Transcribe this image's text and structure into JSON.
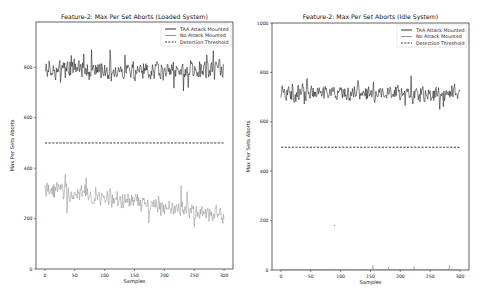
{
  "chart_data": [
    {
      "type": "line",
      "title": "Feature-2: Max Per Set Aborts (Loaded System)",
      "xlabel": "Samples",
      "ylabel": "Max Per Sets Aborts",
      "xlim": [
        -15,
        315
      ],
      "ylim": [
        0,
        980
      ],
      "xticks": [
        0,
        50,
        100,
        150,
        200,
        250,
        300
      ],
      "yticks": [
        0,
        200,
        400,
        600,
        800
      ],
      "grid": false,
      "legend_position": "upper right",
      "legend": [
        "TAA Attack Mounted",
        "No Attack Mounted",
        "Detection Threshold"
      ],
      "series": [
        {
          "name": "TAA Attack Mounted",
          "color": "#1a1a1a",
          "style": "solid",
          "mean": 790,
          "spread": 35,
          "min": 680,
          "max": 870,
          "seed": 7,
          "sample_x": [
            0,
            25,
            50,
            75,
            100,
            125,
            150,
            175,
            200,
            225,
            250,
            275,
            300
          ],
          "sample_values": [
            790,
            800,
            820,
            780,
            770,
            790,
            810,
            780,
            790,
            780,
            785,
            770,
            800
          ]
        },
        {
          "name": "No Attack Mounted",
          "color": "#8a8a8a",
          "style": "solid",
          "start_mean": 320,
          "end_mean": 210,
          "spread": 35,
          "min": 135,
          "max": 385,
          "seed": 13,
          "sample_x": [
            0,
            25,
            50,
            75,
            100,
            125,
            150,
            175,
            200,
            225,
            250,
            275,
            300
          ],
          "sample_values": [
            330,
            290,
            280,
            290,
            260,
            290,
            270,
            280,
            260,
            250,
            240,
            230,
            200
          ]
        },
        {
          "name": "Detection Threshold",
          "color": "#222222",
          "style": "dashed",
          "value": 500
        }
      ]
    },
    {
      "type": "line",
      "title": "Feature-2: Max Per Set Aborts (Idle System)",
      "xlabel": "Samples",
      "ylabel": "Max Per Sets Aborts",
      "xlim": [
        -15,
        315
      ],
      "ylim": [
        0,
        1000
      ],
      "xticks": [
        0,
        50,
        100,
        150,
        200,
        250,
        300
      ],
      "yticks": [
        0,
        200,
        400,
        600,
        800,
        1000
      ],
      "grid": false,
      "legend_position": "upper right",
      "legend": [
        "TAA Attack Mounted",
        "No Attack Mounted",
        "Detection Threshold"
      ],
      "series": [
        {
          "name": "TAA Attack Mounted",
          "color": "#1a1a1a",
          "style": "solid",
          "mean": 715,
          "spread": 30,
          "min": 650,
          "max": 790,
          "seed": 21,
          "sample_x": [
            0,
            25,
            50,
            75,
            100,
            125,
            150,
            175,
            200,
            225,
            250,
            275,
            300
          ],
          "sample_values": [
            700,
            720,
            710,
            730,
            720,
            740,
            720,
            710,
            700,
            720,
            710,
            720,
            710
          ]
        },
        {
          "name": "No Attack Mounted",
          "color": "#8a8a8a",
          "style": "solid",
          "mean": 3,
          "spread": 3,
          "min": 0,
          "max": 20,
          "seed": 31,
          "sample_x": [
            0,
            25,
            50,
            75,
            100,
            125,
            150,
            175,
            200,
            225,
            250,
            275,
            300
          ],
          "sample_values": [
            2,
            4,
            3,
            15,
            2,
            3,
            8,
            3,
            2,
            2,
            2,
            3,
            5
          ]
        },
        {
          "name": "Detection Threshold",
          "color": "#222222",
          "style": "dashed",
          "value": 497
        }
      ],
      "annotations": [
        {
          "text": "·",
          "x": 90,
          "y": 180
        }
      ]
    }
  ],
  "panels": [
    {
      "box": {
        "x": 36,
        "y": 22,
        "w": 197,
        "h": 247
      }
    },
    {
      "box": {
        "x": 272,
        "y": 23,
        "w": 197,
        "h": 247
      }
    }
  ]
}
